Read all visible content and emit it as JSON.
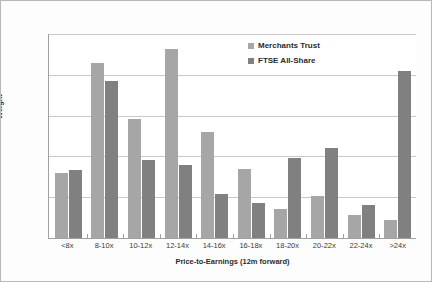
{
  "chart_data": {
    "type": "bar",
    "title": "",
    "xlabel": "Price-to-Earnings (12m forward)",
    "ylabel": "Weight",
    "ylim": [
      0,
      25
    ],
    "ytick_labels": [
      "0%",
      "5%",
      "10%",
      "15%",
      "20%",
      "25%"
    ],
    "ytick_values": [
      0,
      5,
      10,
      15,
      20,
      25
    ],
    "grid": true,
    "legend_position": "top-right",
    "categories": [
      "<8x",
      "8-10x",
      "10-12x",
      "12-14x",
      "14-16x",
      "16-18x",
      "18-20x",
      "20-22x",
      "22-24x",
      ">24x"
    ],
    "series": [
      {
        "name": "Merchants Trust",
        "color": "#a6a6a6",
        "values": [
          8.0,
          21.5,
          14.6,
          23.2,
          13.0,
          8.5,
          3.5,
          5.2,
          2.8,
          2.2
        ]
      },
      {
        "name": "FTSE All-Share",
        "color": "#808080",
        "values": [
          8.3,
          19.3,
          9.5,
          9.0,
          5.4,
          4.3,
          9.8,
          11.0,
          4.0,
          20.5
        ]
      }
    ]
  }
}
